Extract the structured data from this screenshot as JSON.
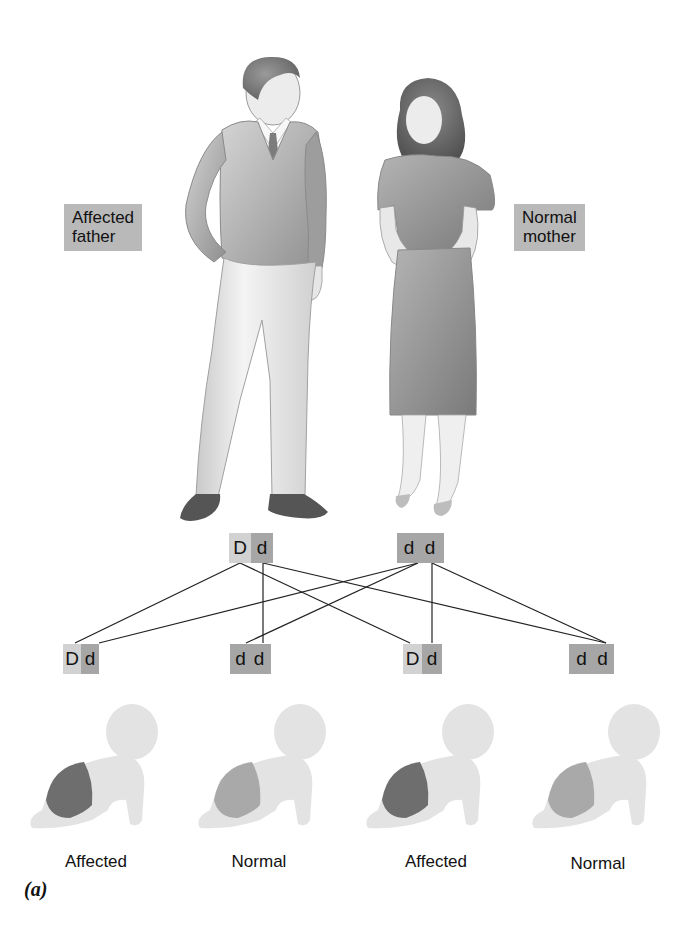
{
  "figure": {
    "panel_label": "(a)",
    "parents": {
      "father": {
        "label_line1": "Affected",
        "label_line2": "father",
        "genotype": [
          "D",
          "d"
        ]
      },
      "mother": {
        "label_line1": "Normal",
        "label_line2": "mother",
        "genotype": [
          "d",
          "d"
        ]
      }
    },
    "offspring": [
      {
        "genotype": [
          "D",
          "d"
        ],
        "phenotype": "Affected"
      },
      {
        "genotype": [
          "d",
          "d"
        ],
        "phenotype": "Normal"
      },
      {
        "genotype": [
          "D",
          "d"
        ],
        "phenotype": "Affected"
      },
      {
        "genotype": [
          "d",
          "d"
        ],
        "phenotype": "Normal"
      }
    ],
    "colors": {
      "dominant_allele": "#d2d2d2",
      "recessive_allele": "#a6a6a6",
      "label_box": "#b9b9b9",
      "affected_diaper": "#6e6e6e",
      "normal_diaper": "#a9a9a9",
      "baby_skin": "#e3e3e3"
    }
  }
}
